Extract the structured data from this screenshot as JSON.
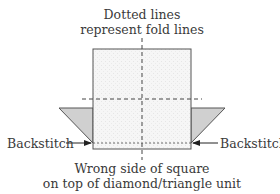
{
  "title": {
    "line1": "Dotted lines",
    "line2": "represent fold lines"
  },
  "labels": {
    "left": "Backstitch",
    "right": "Backstitch"
  },
  "caption": {
    "line1": "Wrong side of square",
    "line2": "on top of diamond/triangle unit"
  },
  "colors": {
    "square_fill": "#f4f4f4",
    "triangle_fill": "#d0d0d0",
    "line": "#555555"
  }
}
